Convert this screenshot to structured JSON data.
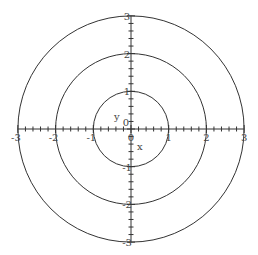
{
  "chart_data": {
    "type": "line",
    "title": "",
    "xlabel": "x",
    "ylabel": "y",
    "xlim": [
      -3,
      3
    ],
    "ylim": [
      -3,
      3
    ],
    "grid": false,
    "legend": null,
    "x_ticks": [
      "-3",
      "-2",
      "-1",
      "0",
      "1",
      "2",
      "3"
    ],
    "y_ticks": [
      "-3",
      "-2",
      "-1",
      "0",
      "1",
      "2",
      "3"
    ],
    "series": [
      {
        "name": "circle r=1",
        "shape": "circle",
        "center": [
          0,
          0
        ],
        "radius": 1
      },
      {
        "name": "circle r=2",
        "shape": "circle",
        "center": [
          0,
          0
        ],
        "radius": 2
      },
      {
        "name": "circle r=3",
        "shape": "circle",
        "center": [
          0,
          0
        ],
        "radius": 3
      }
    ]
  },
  "colors": {
    "curve": "#333333",
    "axis": "#333333",
    "text": "#444444"
  }
}
